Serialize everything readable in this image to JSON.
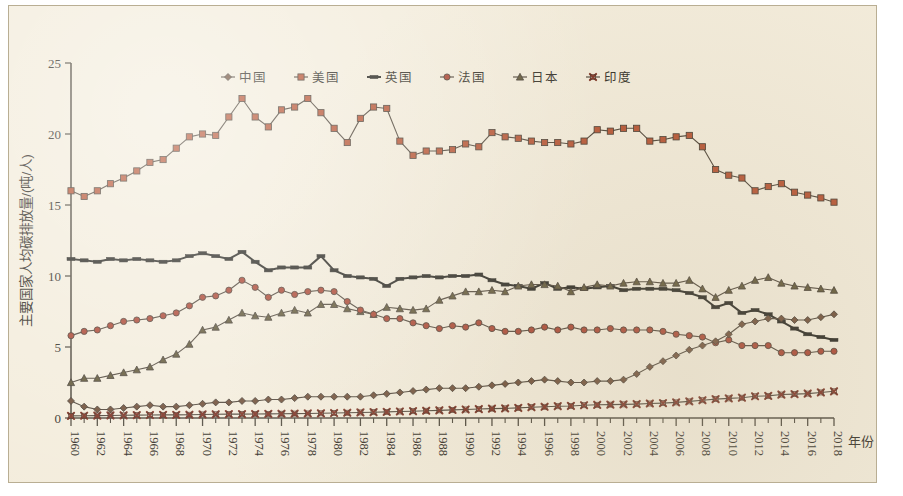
{
  "axes": {
    "ylabel": "主要国家人均碳排放量/(吨/人)",
    "xlabel": "年份",
    "yticks": [
      "0",
      "5",
      "10",
      "15",
      "20",
      "25"
    ],
    "xticks": [
      "1960",
      "1962",
      "1964",
      "1966",
      "1968",
      "1970",
      "1972",
      "1974",
      "1976",
      "1978",
      "1980",
      "1982",
      "1984",
      "1986",
      "1988",
      "1990",
      "1992",
      "1994",
      "1996",
      "1998",
      "2000",
      "2002",
      "2004",
      "2006",
      "2008",
      "2010",
      "2012",
      "2014",
      "2016",
      "2018"
    ]
  },
  "legend": {
    "items": [
      {
        "label": "中国",
        "marker": "diamond",
        "color": "#6b4a33"
      },
      {
        "label": "美国",
        "marker": "square",
        "color": "#b5502f"
      },
      {
        "label": "英国",
        "marker": "dash",
        "color": "#2b2a22"
      },
      {
        "label": "法国",
        "marker": "circle",
        "color": "#a8402c"
      },
      {
        "label": "日本",
        "marker": "triangle",
        "color": "#5c5232"
      },
      {
        "label": "印度",
        "marker": "cross",
        "color": "#7a2d1e"
      }
    ]
  },
  "chart_data": {
    "type": "line",
    "title": "",
    "xlabel": "年份",
    "ylabel": "主要国家人均碳排放量/(吨/人)",
    "xlim": [
      1960,
      2018
    ],
    "ylim": [
      0,
      25
    ],
    "grid": false,
    "legend_position": "top-center",
    "x": [
      1960,
      1961,
      1962,
      1963,
      1964,
      1965,
      1966,
      1967,
      1968,
      1969,
      1970,
      1971,
      1972,
      1973,
      1974,
      1975,
      1976,
      1977,
      1978,
      1979,
      1980,
      1981,
      1982,
      1983,
      1984,
      1985,
      1986,
      1987,
      1988,
      1989,
      1990,
      1991,
      1992,
      1993,
      1994,
      1995,
      1996,
      1997,
      1998,
      1999,
      2000,
      2001,
      2002,
      2003,
      2004,
      2005,
      2006,
      2007,
      2008,
      2009,
      2010,
      2011,
      2012,
      2013,
      2014,
      2015,
      2016,
      2017,
      2018
    ],
    "series": [
      {
        "name": "美国",
        "marker": "square",
        "color": "#b5502f",
        "values": [
          16.0,
          15.6,
          16.0,
          16.5,
          16.9,
          17.4,
          18.0,
          18.2,
          19.0,
          19.8,
          20.0,
          19.9,
          21.2,
          22.5,
          21.2,
          20.5,
          21.7,
          21.9,
          22.5,
          21.5,
          20.4,
          19.4,
          21.1,
          21.9,
          21.8,
          19.5,
          18.5,
          18.8,
          18.8,
          18.9,
          19.3,
          19.1,
          20.1,
          19.8,
          19.7,
          19.5,
          19.4,
          19.4,
          19.3,
          19.5,
          20.3,
          20.2,
          20.4,
          20.4,
          19.5,
          19.6,
          19.8,
          19.9,
          19.1,
          17.5,
          17.1,
          16.9,
          16.0,
          16.3,
          16.5,
          15.9,
          15.7,
          15.5,
          15.2
        ]
      },
      {
        "name": "英国",
        "marker": "dash",
        "color": "#2b2a22",
        "values": [
          11.2,
          11.1,
          11.0,
          11.2,
          11.1,
          11.2,
          11.1,
          11.0,
          11.1,
          11.4,
          11.6,
          11.4,
          11.2,
          11.7,
          11.0,
          10.4,
          10.6,
          10.6,
          10.6,
          11.4,
          10.4,
          10.0,
          9.9,
          9.8,
          9.3,
          9.8,
          9.9,
          10.0,
          9.9,
          10.0,
          10.0,
          10.1,
          9.7,
          9.4,
          9.3,
          9.1,
          9.5,
          9.1,
          9.2,
          9.1,
          9.2,
          9.3,
          9.0,
          9.1,
          9.1,
          9.1,
          9.0,
          8.8,
          8.5,
          7.8,
          8.1,
          7.4,
          7.6,
          7.3,
          6.8,
          6.3,
          5.9,
          5.7,
          5.5
        ]
      },
      {
        "name": "日本",
        "marker": "triangle",
        "color": "#5c5232",
        "values": [
          2.5,
          2.8,
          2.8,
          3.0,
          3.2,
          3.4,
          3.6,
          4.1,
          4.5,
          5.2,
          6.2,
          6.4,
          6.9,
          7.4,
          7.2,
          7.1,
          7.4,
          7.6,
          7.4,
          8.0,
          8.0,
          7.7,
          7.5,
          7.3,
          7.8,
          7.7,
          7.6,
          7.7,
          8.3,
          8.6,
          8.9,
          8.9,
          9.0,
          8.9,
          9.3,
          9.4,
          9.4,
          9.3,
          8.9,
          9.2,
          9.4,
          9.3,
          9.5,
          9.6,
          9.6,
          9.5,
          9.5,
          9.7,
          9.1,
          8.5,
          9.0,
          9.3,
          9.7,
          9.9,
          9.5,
          9.3,
          9.2,
          9.1,
          9.0
        ]
      },
      {
        "name": "法国",
        "marker": "circle",
        "color": "#a8402c",
        "values": [
          5.8,
          6.1,
          6.2,
          6.5,
          6.8,
          6.9,
          7.0,
          7.2,
          7.4,
          7.9,
          8.5,
          8.6,
          9.0,
          9.7,
          9.2,
          8.5,
          9.0,
          8.7,
          8.9,
          9.0,
          8.9,
          8.2,
          7.6,
          7.3,
          7.0,
          7.0,
          6.7,
          6.5,
          6.3,
          6.5,
          6.4,
          6.7,
          6.3,
          6.1,
          6.1,
          6.2,
          6.4,
          6.2,
          6.4,
          6.2,
          6.2,
          6.3,
          6.2,
          6.2,
          6.2,
          6.1,
          5.9,
          5.8,
          5.7,
          5.3,
          5.5,
          5.1,
          5.1,
          5.1,
          4.6,
          4.6,
          4.6,
          4.7,
          4.7
        ]
      },
      {
        "name": "中国",
        "marker": "diamond",
        "color": "#6b4a33",
        "values": [
          1.2,
          0.8,
          0.6,
          0.6,
          0.7,
          0.8,
          0.9,
          0.8,
          0.8,
          0.9,
          1.0,
          1.1,
          1.1,
          1.2,
          1.2,
          1.3,
          1.3,
          1.4,
          1.5,
          1.5,
          1.5,
          1.5,
          1.5,
          1.6,
          1.7,
          1.8,
          1.9,
          2.0,
          2.1,
          2.1,
          2.1,
          2.2,
          2.3,
          2.4,
          2.5,
          2.6,
          2.7,
          2.6,
          2.5,
          2.5,
          2.6,
          2.6,
          2.7,
          3.1,
          3.6,
          4.0,
          4.4,
          4.8,
          5.1,
          5.4,
          5.9,
          6.6,
          6.8,
          7.0,
          7.0,
          6.9,
          6.9,
          7.1,
          7.3
        ]
      },
      {
        "name": "印度",
        "marker": "cross",
        "color": "#7a2d1e",
        "values": [
          0.15,
          0.16,
          0.17,
          0.18,
          0.19,
          0.2,
          0.21,
          0.22,
          0.22,
          0.23,
          0.25,
          0.26,
          0.27,
          0.27,
          0.28,
          0.29,
          0.3,
          0.31,
          0.32,
          0.33,
          0.35,
          0.37,
          0.39,
          0.41,
          0.43,
          0.46,
          0.48,
          0.51,
          0.54,
          0.57,
          0.6,
          0.63,
          0.66,
          0.68,
          0.71,
          0.76,
          0.79,
          0.83,
          0.85,
          0.9,
          0.93,
          0.94,
          0.96,
          0.98,
          1.02,
          1.05,
          1.1,
          1.17,
          1.25,
          1.33,
          1.38,
          1.43,
          1.53,
          1.56,
          1.65,
          1.68,
          1.72,
          1.8,
          1.88
        ]
      }
    ]
  }
}
